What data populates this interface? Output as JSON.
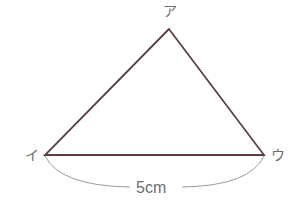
{
  "figure": {
    "type": "triangle",
    "vertices": {
      "top": {
        "label": "ア",
        "x": 169,
        "y": 29
      },
      "left": {
        "label": "イ",
        "x": 45,
        "y": 155
      },
      "right": {
        "label": "ウ",
        "x": 264,
        "y": 155
      }
    },
    "base_length_label": "5cm",
    "colors": {
      "edge": "#5a3e3e",
      "dimension_arc": "#9a9a9a",
      "text": "#6e6e6e"
    }
  }
}
